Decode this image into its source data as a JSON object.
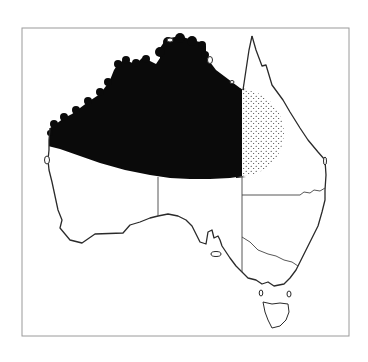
{
  "figure": {
    "type": "distribution-map",
    "region": "Australia",
    "frame": {
      "x": 22,
      "y": 28,
      "width": 327,
      "height": 308,
      "stroke": "#9a9a9a"
    },
    "colors": {
      "background": "#ffffff",
      "coastline": "#2a2a2a",
      "border": "#444444",
      "range_solid": "#0a0a0a",
      "range_stipple": "#1a1a1a"
    },
    "legend": [],
    "layers": [
      {
        "name": "solid-range",
        "description": "Northern Australia, solid black distribution area",
        "fill": "#0a0a0a"
      },
      {
        "name": "stippled-range",
        "description": "Stippled semicircle in north Queensland, marginal range",
        "fill": "stipple"
      }
    ]
  }
}
